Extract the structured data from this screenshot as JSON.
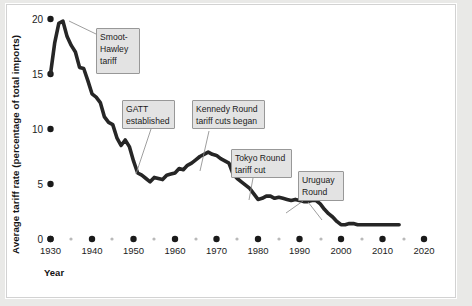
{
  "figure": {
    "background": "#ffffff",
    "page_background": "#e9e9e7",
    "line_color": "#262626",
    "callout_fill": "#e3e3e3",
    "callout_border": "#8d8d8d"
  },
  "axes": {
    "x_title": "Year",
    "y_title": "Average tariff rate (percentage of total imports)",
    "x_ticks": [
      "1930",
      "1940",
      "1950",
      "1960",
      "1970",
      "1980",
      "1990",
      "2000",
      "2010",
      "2020"
    ],
    "x_minor_ticks": [
      "1935",
      "1945",
      "1955",
      "1965",
      "1975",
      "1985",
      "1995",
      "2005",
      "2015"
    ],
    "y_ticks": [
      "0",
      "5",
      "10",
      "15",
      "20"
    ]
  },
  "annotations": [
    {
      "id": "smoot-hawley",
      "lines": [
        "Smoot-",
        "Hawley",
        "tariff"
      ]
    },
    {
      "id": "gatt",
      "lines": [
        "GATT",
        "established"
      ]
    },
    {
      "id": "kennedy-round",
      "lines": [
        "Kennedy Round",
        "tariff cuts began"
      ]
    },
    {
      "id": "tokyo-round",
      "lines": [
        "Tokyo Round",
        "tariff cut"
      ]
    },
    {
      "id": "uruguay-round",
      "lines": [
        "Uruguay",
        "Round"
      ]
    }
  ],
  "chart_data": {
    "type": "line",
    "title": "",
    "xlabel": "Year",
    "ylabel": "Average tariff rate (percentage of total imports)",
    "xlim": [
      1929,
      2021
    ],
    "ylim": [
      0,
      21
    ],
    "grid": false,
    "legend": null,
    "x": [
      1930,
      1931,
      1932,
      1933,
      1934,
      1935,
      1936,
      1937,
      1938,
      1939,
      1940,
      1941,
      1942,
      1943,
      1944,
      1945,
      1946,
      1947,
      1948,
      1949,
      1950,
      1951,
      1952,
      1953,
      1954,
      1955,
      1956,
      1957,
      1958,
      1959,
      1960,
      1961,
      1962,
      1963,
      1964,
      1965,
      1966,
      1967,
      1968,
      1969,
      1970,
      1971,
      1972,
      1973,
      1974,
      1975,
      1976,
      1977,
      1978,
      1979,
      1980,
      1981,
      1982,
      1983,
      1984,
      1985,
      1986,
      1987,
      1988,
      1989,
      1990,
      1991,
      1992,
      1993,
      1994,
      1995,
      1996,
      1997,
      1998,
      1999,
      2000,
      2001,
      2002,
      2003,
      2004,
      2005,
      2006,
      2007,
      2008,
      2009,
      2010,
      2011,
      2012,
      2013,
      2014
    ],
    "values": [
      15.0,
      17.8,
      19.6,
      19.8,
      18.4,
      17.6,
      17.0,
      15.6,
      15.5,
      14.4,
      13.2,
      12.9,
      12.4,
      11.1,
      10.6,
      10.4,
      9.2,
      8.5,
      9.0,
      8.4,
      7.1,
      6.0,
      5.8,
      5.5,
      5.2,
      5.6,
      5.5,
      5.4,
      5.8,
      5.9,
      6.0,
      6.4,
      6.3,
      6.7,
      6.9,
      7.2,
      7.5,
      7.7,
      7.9,
      7.7,
      7.6,
      7.3,
      7.1,
      6.9,
      5.9,
      5.5,
      5.2,
      4.9,
      4.6,
      4.1,
      3.6,
      3.7,
      3.9,
      3.9,
      3.7,
      3.8,
      3.7,
      3.6,
      3.5,
      3.6,
      3.5,
      3.4,
      3.4,
      3.5,
      3.5,
      3.2,
      2.7,
      2.3,
      2.0,
      1.6,
      1.3,
      1.3,
      1.4,
      1.4,
      1.3,
      1.3,
      1.3,
      1.3,
      1.3,
      1.3,
      1.3,
      1.3,
      1.3,
      1.3,
      1.3
    ]
  }
}
